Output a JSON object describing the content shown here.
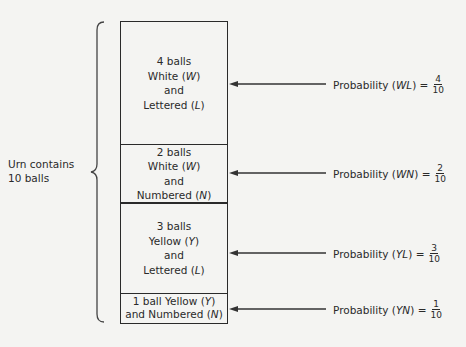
{
  "urn": {
    "line1": "Urn contains",
    "line2": "10 balls"
  },
  "boxes": [
    {
      "count": "4 balls",
      "color": "White",
      "color_sym": "W",
      "and": "and",
      "type": "Lettered",
      "type_sym": "L"
    },
    {
      "count": "2 balls",
      "color": "White",
      "color_sym": "W",
      "and": "and",
      "type": "Numbered",
      "type_sym": "N"
    },
    {
      "count": "3 balls",
      "color": "Yellow",
      "color_sym": "Y",
      "and": "and",
      "type": "Lettered",
      "type_sym": "L"
    },
    {
      "count": "1 ball",
      "color": "Yellow",
      "color_sym": "Y",
      "and": "and",
      "type": "Numbered",
      "type_sym": "N"
    }
  ],
  "probabilities": [
    {
      "label": "Probability",
      "event": "WL",
      "num": "4",
      "den": "10"
    },
    {
      "label": "Probability",
      "event": "WN",
      "num": "2",
      "den": "10"
    },
    {
      "label": "Probability",
      "event": "YL",
      "num": "3",
      "den": "10"
    },
    {
      "label": "Probability",
      "event": "YN",
      "num": "1",
      "den": "10"
    }
  ],
  "colors": {
    "ink": "#2a2a2a",
    "background": "#f4f4f2"
  }
}
